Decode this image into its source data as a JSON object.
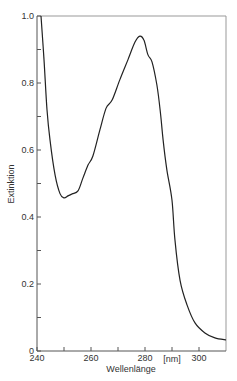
{
  "chart_data": {
    "type": "line",
    "title": "",
    "xlabel": "Wellenlänge",
    "xunit": "[nm]",
    "ylabel": "Extinktion",
    "xlim": [
      240,
      310
    ],
    "ylim": [
      0,
      1.0
    ],
    "x_ticks": [
      240,
      250,
      260,
      270,
      280,
      290,
      300
    ],
    "x_tick_labels": [
      "240",
      "260",
      "280",
      "300"
    ],
    "x_tick_label_values": [
      240,
      260,
      280,
      300
    ],
    "y_ticks": [
      0,
      0.1,
      0.2,
      0.3,
      0.4,
      0.5,
      0.6,
      0.7,
      0.8,
      0.9,
      1.0
    ],
    "y_tick_labels": [
      "0",
      "0.2",
      "0.4",
      "0.6",
      "0.8",
      "1.0"
    ],
    "y_tick_label_values": [
      0,
      0.2,
      0.4,
      0.6,
      0.8,
      1.0
    ],
    "grid": false,
    "legend": null,
    "series": [
      {
        "name": "Extinktion",
        "x": [
          241.5,
          242.6,
          243.7,
          244.8,
          246.7,
          248.5,
          250.0,
          251.5,
          253.0,
          255.2,
          257.0,
          258.9,
          260.7,
          263.3,
          265.6,
          267.8,
          270.7,
          273.7,
          276.3,
          278.1,
          279.6,
          281.1,
          282.6,
          284.4,
          285.6,
          286.7,
          288.1,
          290.0,
          291.1,
          293.0,
          295.6,
          298.5,
          302.2,
          305.9,
          310.0
        ],
        "values": [
          1.0,
          0.87,
          0.72,
          0.63,
          0.525,
          0.47,
          0.457,
          0.463,
          0.469,
          0.478,
          0.516,
          0.555,
          0.582,
          0.66,
          0.725,
          0.749,
          0.81,
          0.87,
          0.922,
          0.94,
          0.928,
          0.884,
          0.863,
          0.794,
          0.72,
          0.63,
          0.54,
          0.45,
          0.33,
          0.21,
          0.137,
          0.084,
          0.054,
          0.039,
          0.033
        ]
      }
    ],
    "annotations": [
      {
        "text": "absorption maximum",
        "x": 278,
        "y": 0.94
      },
      {
        "text": "minimum",
        "x": 250,
        "y": 0.455
      }
    ]
  },
  "colors": {
    "line": "#222222",
    "axis": "#555555",
    "frame": "#999999"
  }
}
